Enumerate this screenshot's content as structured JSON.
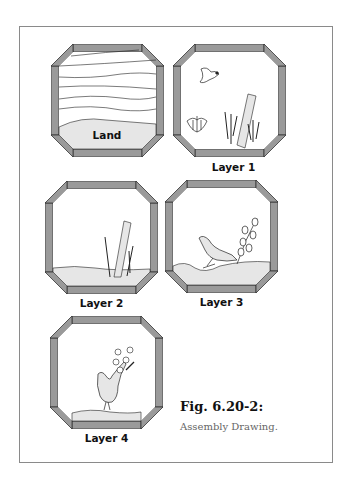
{
  "figure": {
    "title": "Fig. 6.20-2:",
    "subtitle": "Assembly Drawing."
  },
  "panels": [
    {
      "id": "land",
      "label": "Land",
      "contents": [
        "sky-lines",
        "land-ground"
      ]
    },
    {
      "id": "layer1",
      "label": "Layer 1",
      "contents": [
        "flying-bird",
        "flower-bud",
        "reeds",
        "post"
      ]
    },
    {
      "id": "layer2",
      "label": "Layer 2",
      "contents": [
        "ground",
        "post",
        "reeds"
      ]
    },
    {
      "id": "layer3",
      "label": "Layer 3",
      "contents": [
        "ground",
        "dove",
        "leafy-branch"
      ]
    },
    {
      "id": "layer4",
      "label": "Layer 4",
      "contents": [
        "ground",
        "pheasant",
        "flowers"
      ]
    }
  ],
  "colors": {
    "frame_fill": "#9a9a9a",
    "frame_stroke": "#333333",
    "ground_fill": "#e6e6e6",
    "line": "#222222"
  }
}
